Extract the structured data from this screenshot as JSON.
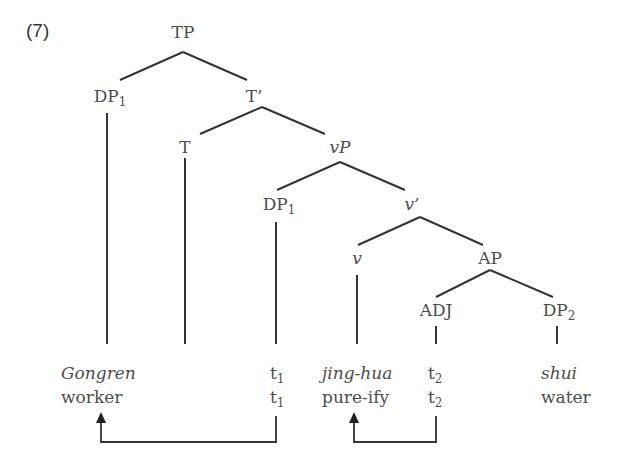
{
  "example_number": "(7)",
  "tree": {
    "nodes": {
      "TP": {
        "label": "TP",
        "sub": ""
      },
      "DP1_spec": {
        "label": "DP",
        "sub": "1"
      },
      "Tbar": {
        "label": "T’",
        "sub": ""
      },
      "T": {
        "label": "T",
        "sub": ""
      },
      "vP": {
        "label": "vP",
        "sub": ""
      },
      "DP1_low": {
        "label": "DP",
        "sub": "1"
      },
      "vbar": {
        "label": "v’",
        "sub": ""
      },
      "v": {
        "label": "v",
        "sub": ""
      },
      "AP": {
        "label": "AP",
        "sub": ""
      },
      "ADJ": {
        "label": "ADJ",
        "sub": ""
      },
      "DP2": {
        "label": "DP",
        "sub": "2"
      }
    },
    "leaves": [
      {
        "form": "Gongren",
        "gloss": "worker"
      },
      {
        "form": "t1",
        "form_base": "t",
        "form_sub": "1",
        "gloss_base": "t",
        "gloss_sub": "1"
      },
      {
        "form": "jing-hua",
        "gloss": "pure-ify"
      },
      {
        "form": "t2",
        "form_base": "t",
        "form_sub": "2",
        "gloss_base": "t",
        "gloss_sub": "2"
      },
      {
        "form": "shui",
        "gloss": "water"
      }
    ],
    "movement_arrows": [
      {
        "from": "t1",
        "to": "Gongren"
      },
      {
        "from": "t2",
        "to": "jing-hua"
      }
    ]
  }
}
